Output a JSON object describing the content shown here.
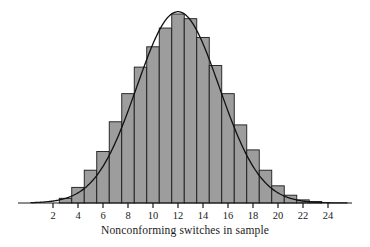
{
  "chart_data": {
    "type": "bar",
    "title": "",
    "subtitle": "",
    "xlabel": "Nonconforming switches in sample",
    "ylabel": "",
    "xlim": [
      0.5,
      25.5
    ],
    "ylim": [
      0,
      0.125
    ],
    "grid": false,
    "legend": null,
    "annotations": [],
    "bar_style": {
      "fill": "#9d9d9d",
      "stroke": "#1a1a1a",
      "stroke_width": 0.9,
      "bin_width": 1
    },
    "axis_style": {
      "axis_color": "#1a1a1a",
      "tick_color": "#1a1a1a",
      "tick_length": 5
    },
    "xticks": [
      2,
      4,
      6,
      8,
      10,
      12,
      14,
      16,
      18,
      20,
      22,
      24
    ],
    "xtick_labels": [
      "2",
      "4",
      "6",
      "8",
      "10",
      "12",
      "14",
      "16",
      "18",
      "20",
      "22",
      "24"
    ],
    "categories": [
      1,
      2,
      3,
      4,
      5,
      6,
      7,
      8,
      9,
      10,
      11,
      12,
      13,
      14,
      15,
      16,
      17,
      18,
      19,
      20,
      21,
      22,
      23,
      24
    ],
    "values": [
      0.0,
      0.0,
      0.003,
      0.01,
      0.021,
      0.033,
      0.052,
      0.07,
      0.087,
      0.1,
      0.112,
      0.121,
      0.118,
      0.106,
      0.088,
      0.07,
      0.05,
      0.034,
      0.021,
      0.011,
      0.005,
      0.002,
      0.001,
      0.0
    ],
    "series": [
      {
        "name": "Binomial histogram",
        "type": "bar",
        "values": [
          0.0,
          0.0,
          0.003,
          0.01,
          0.021,
          0.033,
          0.052,
          0.07,
          0.087,
          0.1,
          0.112,
          0.121,
          0.118,
          0.106,
          0.088,
          0.07,
          0.05,
          0.034,
          0.021,
          0.011,
          0.005,
          0.002,
          0.001,
          0.0
        ]
      },
      {
        "name": "Normal approximation curve",
        "type": "line",
        "color": "#111111",
        "line_width": 1.3,
        "mean": 12.0,
        "sd": 3.3,
        "peak_value": 0.1225
      }
    ]
  },
  "figure": {
    "x_axis_caption": "Nonconforming switches in sample"
  }
}
